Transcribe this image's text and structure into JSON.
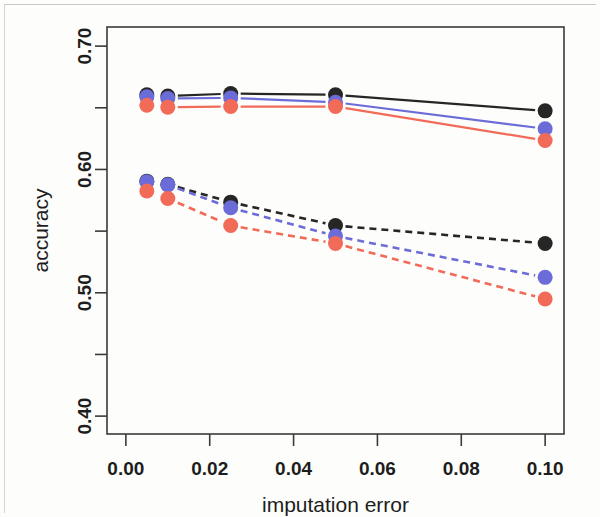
{
  "figure": {
    "background_color": "#fdfdfb",
    "frame_color": "#3a3a3a"
  },
  "axes": {
    "x_title": "imputation error",
    "y_title": "accuracy",
    "x_tick_labels": [
      "0.00",
      "0.02",
      "0.04",
      "0.06",
      "0.08",
      "0.10"
    ],
    "y_tick_labels": [
      "0.40",
      "0.50",
      "0.60",
      "0.70"
    ]
  },
  "chart_data": {
    "type": "line",
    "title": "",
    "subtitle": "",
    "xlabel": "imputation error",
    "ylabel": "accuracy",
    "xlim": [
      -0.0045,
      0.1045
    ],
    "ylim": [
      0.3855,
      0.7155
    ],
    "grid": false,
    "legend": "none",
    "x_ticks": [
      0.0,
      0.02,
      0.04,
      0.06,
      0.08,
      0.1
    ],
    "x_tick_labels": [
      "0.00",
      "0.02",
      "0.04",
      "0.06",
      "0.08",
      "0.10"
    ],
    "y_ticks": [
      0.4,
      0.45,
      0.5,
      0.55,
      0.6,
      0.65,
      0.7
    ],
    "y_tick_labels": [
      "0.40",
      "",
      "0.50",
      "",
      "0.60",
      "",
      "0.70"
    ],
    "y_major_ticks": [
      0.4,
      0.5,
      0.6,
      0.7
    ],
    "y_minor_ticks": [
      0.45,
      0.55,
      0.65
    ],
    "x": [
      0.005,
      0.01,
      0.025,
      0.05,
      0.1
    ],
    "markers": "filled-circle",
    "series": [
      {
        "name": "black-solid",
        "color": "#262626",
        "linestyle": "solid",
        "values": [
          0.6605,
          0.6595,
          0.6615,
          0.6605,
          0.6475
        ]
      },
      {
        "name": "blue-solid",
        "color": "#6c6cd8",
        "linestyle": "solid",
        "values": [
          0.659,
          0.6575,
          0.658,
          0.6545,
          0.633
        ]
      },
      {
        "name": "red-solid",
        "color": "#f26a58",
        "linestyle": "solid",
        "values": [
          0.652,
          0.6505,
          0.651,
          0.651,
          0.6235
        ]
      },
      {
        "name": "black-dashed",
        "color": "#262626",
        "linestyle": "dashed",
        "values": [
          0.5905,
          0.588,
          0.5735,
          0.5545,
          0.54
        ]
      },
      {
        "name": "blue-dashed",
        "color": "#6c6cd8",
        "linestyle": "dashed",
        "values": [
          0.59,
          0.5875,
          0.569,
          0.546,
          0.5125
        ]
      },
      {
        "name": "red-dashed",
        "color": "#f26a58",
        "linestyle": "dashed",
        "values": [
          0.5825,
          0.5765,
          0.5545,
          0.54,
          0.495
        ]
      }
    ]
  }
}
